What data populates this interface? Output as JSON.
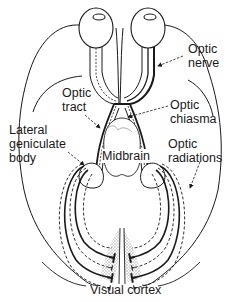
{
  "diagram": {
    "colors": {
      "line": "#1a1a1a",
      "stipple": "#bdbdbd",
      "background": "#ffffff"
    },
    "labels": [
      {
        "id": "optic-nerve",
        "text": "Optic\nnerve",
        "x": 188,
        "y": 42,
        "align": "left"
      },
      {
        "id": "optic-tract",
        "text": "Optic\ntract",
        "x": 62,
        "y": 86,
        "align": "left"
      },
      {
        "id": "optic-chiasma",
        "text": "Optic\nchiasma",
        "x": 170,
        "y": 98,
        "align": "left"
      },
      {
        "id": "lateral-geniculate-body",
        "text": "Lateral\ngeniculate\nbody",
        "x": 9,
        "y": 123,
        "align": "left"
      },
      {
        "id": "optic-radiations",
        "text": "Optic\nradiations",
        "x": 168,
        "y": 137,
        "align": "left"
      },
      {
        "id": "midbrain",
        "text": "Midbrain",
        "x": 102,
        "y": 149,
        "align": "left"
      },
      {
        "id": "visual-cortex",
        "text": "Visual cortex",
        "x": 90,
        "y": 285,
        "align": "left"
      }
    ]
  }
}
